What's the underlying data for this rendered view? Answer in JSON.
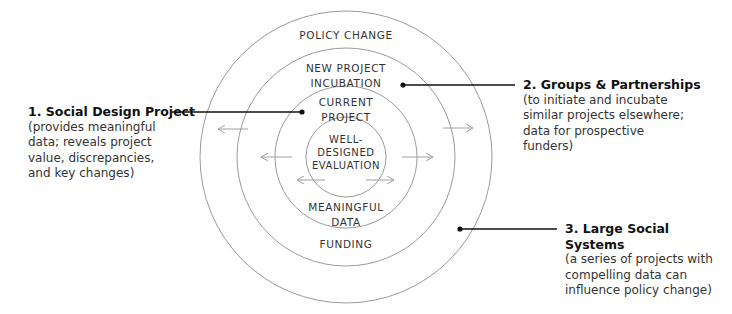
{
  "diagram": {
    "rings": [
      {
        "id": "outer",
        "label": "POLICY CHANGE",
        "bottom_label": ""
      },
      {
        "id": "second",
        "label": "NEW PROJECT\nINCUBATION",
        "bottom_label": "FUNDING"
      },
      {
        "id": "third",
        "label": "CURRENT\nPROJECT",
        "bottom_label": "MEANINGFUL\nDATA"
      },
      {
        "id": "core",
        "label": "WELL-\nDESIGNED\nEVALUATION",
        "bottom_label": ""
      }
    ],
    "callouts": [
      {
        "title": "1. Social Design Project",
        "description": "(provides meaningful\ndata; reveals project\nvalue, discrepancies,\nand key changes)"
      },
      {
        "title": "2. Groups & Partnerships",
        "description": "(to initiate and incubate\nsimilar projects elsewhere;\ndata for prospective\nfunders)"
      },
      {
        "title": "3. Large Social Systems",
        "description": "(a series of projects with\ncompelling data can\ninfluence policy change)"
      }
    ],
    "colors": {
      "ring_stroke": "#9a9a9a",
      "arrow": "#a0a0a0",
      "leader": "#111111"
    }
  }
}
